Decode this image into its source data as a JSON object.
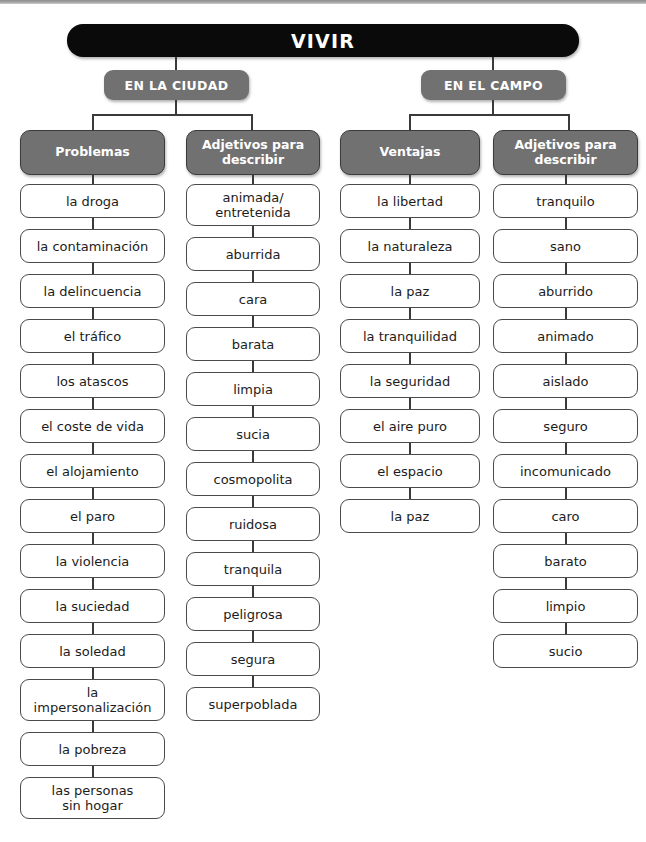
{
  "diagram": {
    "root": {
      "label": "VIVIR"
    },
    "branches": [
      {
        "label": "EN LA CIUDAD"
      },
      {
        "label": "EN EL CAMPO"
      }
    ],
    "columns": [
      {
        "header": "Problemas",
        "header_lines": [
          "Problemas"
        ],
        "items": [
          "la droga",
          "la contaminación",
          "la delincuencia",
          "el tráfico",
          "los atascos",
          "el coste de vida",
          "el alojamiento",
          "el paro",
          "la violencia",
          "la suciedad",
          "la soledad",
          "la\nimpersonalización",
          "la pobreza",
          "las personas\nsin hogar"
        ]
      },
      {
        "header": "Adjetivos para describir",
        "header_lines": [
          "Adjetivos para",
          "describir"
        ],
        "items": [
          "animada/\nentretenida",
          "aburrida",
          "cara",
          "barata",
          "limpia",
          "sucia",
          "cosmopolita",
          "ruidosa",
          "tranquila",
          "peligrosa",
          "segura",
          "superpoblada"
        ]
      },
      {
        "header": "Ventajas",
        "header_lines": [
          "Ventajas"
        ],
        "items": [
          "la libertad",
          "la naturaleza",
          "la paz",
          "la tranquilidad",
          "la seguridad",
          "el aire puro",
          "el espacio",
          "la paz"
        ]
      },
      {
        "header": "Adjetivos para describir",
        "header_lines": [
          "Adjetivos para",
          "describir"
        ],
        "items": [
          "tranquilo",
          "sano",
          "aburrido",
          "animado",
          "aislado",
          "seguro",
          "incomunicado",
          "caro",
          "barato",
          "limpio",
          "sucio"
        ]
      }
    ],
    "colors": {
      "root_fill": "#0a0a0a",
      "header_fill": "#717171",
      "header_text": "#ffffff",
      "item_fill": "#ffffff",
      "item_border": "#4a4a4a",
      "item_text": "#1c1c1c",
      "connector": "#3a3a3a",
      "page_background": "#ffffff"
    }
  }
}
